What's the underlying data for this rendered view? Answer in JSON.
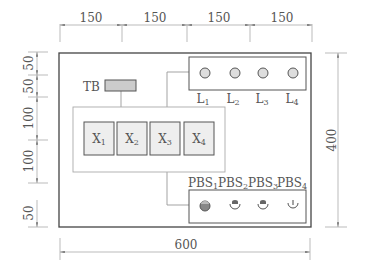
{
  "diagram": {
    "top_dimensions": [
      "150",
      "150",
      "150",
      "150"
    ],
    "left_dimensions": [
      "50",
      "50",
      "100",
      "100",
      "50"
    ],
    "right_dimension": "400",
    "bottom_dimension": "600",
    "terminal_block": {
      "label": "TB"
    },
    "relays": [
      {
        "base": "X",
        "sub": "1"
      },
      {
        "base": "X",
        "sub": "2"
      },
      {
        "base": "X",
        "sub": "3"
      },
      {
        "base": "X",
        "sub": "4"
      }
    ],
    "lamps": [
      {
        "base": "L",
        "sub": "1"
      },
      {
        "base": "L",
        "sub": "2"
      },
      {
        "base": "L",
        "sub": "3"
      },
      {
        "base": "L",
        "sub": "4"
      }
    ],
    "push_buttons": [
      {
        "base": "PBS",
        "sub": "1",
        "style": "filled"
      },
      {
        "base": "PBS",
        "sub": "2",
        "style": "hollow"
      },
      {
        "base": "PBS",
        "sub": "3",
        "style": "hollow"
      },
      {
        "base": "PBS",
        "sub": "4",
        "style": "hollow-pointer"
      }
    ],
    "colors": {
      "outline": "#444444",
      "light_line": "#999999",
      "box_fill": "#eeeeee",
      "tb_fill": "#cccccc",
      "lamp_fill": "#dddddd",
      "button_filled": "#888888"
    }
  }
}
